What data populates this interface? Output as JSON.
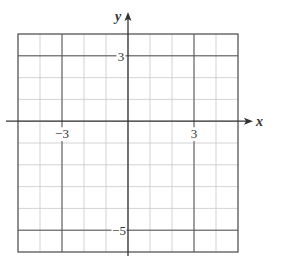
{
  "chart_data": {
    "type": "scatter",
    "title": "",
    "xlabel": "x",
    "ylabel": "y",
    "xlim": [
      -5,
      5
    ],
    "ylim": [
      -6,
      4
    ],
    "grid": true,
    "grid_step": 1,
    "emphasized_lines": {
      "vertical": [
        -3,
        3
      ],
      "horizontal": [
        3,
        -5
      ]
    },
    "x_tick_labels": [
      {
        "value": -3,
        "label": "−3"
      },
      {
        "value": 3,
        "label": "3"
      }
    ],
    "y_tick_labels": [
      {
        "value": 3,
        "label": "3"
      },
      {
        "value": -5,
        "label": "−5"
      }
    ],
    "series": [],
    "legend": null
  },
  "colors": {
    "grid_minor": "#c8c8c8",
    "grid_major": "#555555",
    "axis": "#333333",
    "background": "#ffffff"
  },
  "labels": {
    "x_axis": "x",
    "y_axis": "y",
    "x_neg3": "−3",
    "x_pos3": "3",
    "y_pos3": "3",
    "y_neg5": "−5"
  }
}
